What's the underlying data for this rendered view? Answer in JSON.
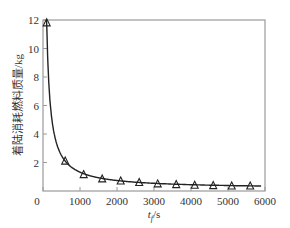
{
  "chart_data": {
    "type": "line",
    "title": "",
    "xlabel": "t_f/s",
    "xlabel_main": "t",
    "xlabel_sub": "f",
    "xlabel_unit": "/s",
    "ylabel": "着陆消耗燃料质量/kg",
    "xlim": [
      0,
      6000
    ],
    "ylim": [
      0,
      12
    ],
    "x_ticks": [
      0,
      1000,
      2000,
      3000,
      4000,
      5000,
      6000
    ],
    "y_ticks": [
      2,
      4,
      6,
      8,
      10,
      12
    ],
    "grid": false,
    "legend": null,
    "series": [
      {
        "name": "fuel mass",
        "marker": "triangle",
        "x": [
          100,
          600,
          1100,
          1600,
          2100,
          2600,
          3100,
          3600,
          4100,
          4600,
          5100,
          5600
        ],
        "values": [
          11.8,
          2.1,
          1.15,
          0.85,
          0.7,
          0.6,
          0.5,
          0.45,
          0.4,
          0.38,
          0.35,
          0.35
        ]
      }
    ]
  },
  "colors": {
    "axis": "#9a9a9a",
    "line": "#222222",
    "marker": "#222222",
    "text": "#333333"
  }
}
